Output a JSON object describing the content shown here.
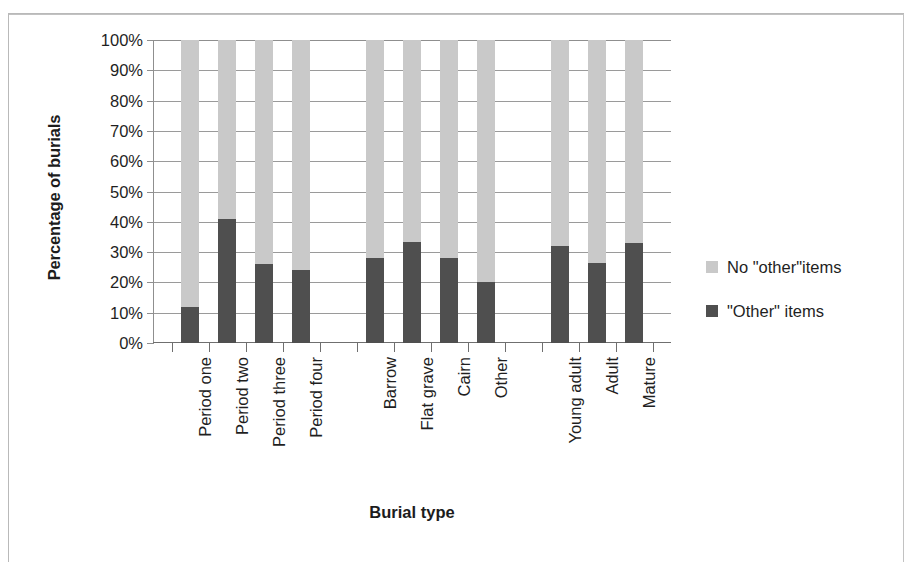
{
  "chart_data": {
    "type": "bar",
    "subtype": "100% stacked column",
    "title": "",
    "xlabel": "Burial type",
    "ylabel": "Percentage of burials",
    "ylim": [
      0,
      100
    ],
    "yticks": [
      "0%",
      "10%",
      "20%",
      "30%",
      "40%",
      "50%",
      "60%",
      "70%",
      "80%",
      "90%",
      "100%"
    ],
    "ytick_values": [
      0,
      10,
      20,
      30,
      40,
      50,
      60,
      70,
      80,
      90,
      100
    ],
    "grid": true,
    "legend_position": "right",
    "categories": [
      "Period one",
      "Period two",
      "Period three",
      "Period four",
      "",
      "Barrow",
      "Flat grave",
      "Cairn",
      "Other",
      "",
      "Young adult",
      "Adult",
      "Mature"
    ],
    "series": [
      {
        "name": "\"Other\" items",
        "color": "#4f4f4f",
        "values": [
          12,
          41,
          26,
          24,
          null,
          28,
          33.5,
          28,
          20,
          null,
          32,
          26.5,
          33
        ]
      },
      {
        "name": "No \"other\"items",
        "color": "#c9c9c9",
        "values": [
          88,
          59,
          74,
          76,
          null,
          72,
          66.5,
          72,
          80,
          null,
          68,
          73.5,
          67
        ]
      }
    ],
    "legend": [
      {
        "label": "No \"other\"items",
        "color": "#c9c9c9",
        "swatch": "legend-swatch-light"
      },
      {
        "label": "\"Other\" items",
        "color": "#4f4f4f",
        "swatch": "legend-swatch-dark"
      }
    ]
  },
  "axes": {
    "y_title": "Percentage of burials",
    "x_title": "Burial type"
  }
}
